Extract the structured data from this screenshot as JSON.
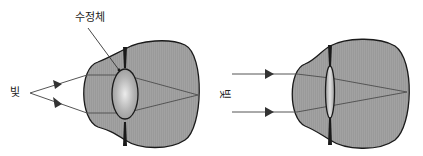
{
  "figures": [
    {
      "id": "left-eye",
      "description": "Eye with thickened lens (near focus), light rays diverging from a point",
      "labels": {
        "lens": "수정체",
        "light": "빛"
      }
    },
    {
      "id": "right-eye",
      "description": "Eye with thinned lens (far focus), parallel light rays",
      "labels": {
        "light": "빛"
      }
    }
  ],
  "colors": {
    "eyeball_fill": "#9a9a9a",
    "outline": "#1a1a1a",
    "ray": "#555555",
    "lens_highlight": "#e8e8e8",
    "text": "#222222"
  }
}
